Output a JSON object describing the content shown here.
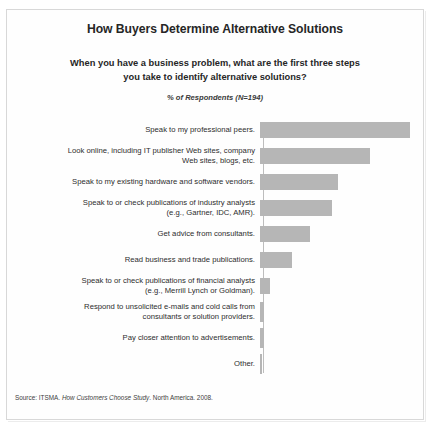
{
  "figure": {
    "title": "How Buyers Determine Alternative Solutions",
    "subtitle_line1": "When you have a business problem, what are the first three steps",
    "subtitle_line2": "you take to identify alternative solutions?",
    "note": "% of Respondents (N=194)",
    "source_prefix": "Source: ITSMA. ",
    "source_italic": "How Customers Choose Study",
    "source_suffix": ". North America. 2008.",
    "bar_color": "#b6b6b6",
    "axis_color": "#bdbdbd",
    "frame_color": "#d8d8d8"
  },
  "chart_data": {
    "type": "bar",
    "orientation": "horizontal",
    "title": "How Buyers Determine Alternative Solutions",
    "subtitle": "When you have a business problem, what are the first three steps you take to identify alternative solutions?",
    "xlabel": "% of Respondents (N=194)",
    "ylabel": "",
    "grid": false,
    "legend": null,
    "xlim": [
      0,
      100
    ],
    "sample_size": 194,
    "categories": [
      "Speak to my professional peers.",
      "Look online, including IT publisher Web sites, company Web sites, blogs, etc.",
      "Speak to my existing hardware and software vendors.",
      "Speak to or check publications of industry analysts (e.g., Gartner, IDC, AMR).",
      "Get advice from consultants.",
      "Read business and trade publications.",
      "Speak to or check publications of financial analysts (e.g., Merrill Lynch or Goldman).",
      "Respond to unsolicited e-mails and cold calls from consultants or solution providers.",
      "Pay closer attention to advertisements.",
      "Other."
    ],
    "category_lines": [
      [
        "Speak to my professional peers.",
        ""
      ],
      [
        "Look online, including IT publisher Web sites, company",
        "Web sites, blogs, etc."
      ],
      [
        "Speak to my existing hardware and software vendors.",
        ""
      ],
      [
        "Speak to or check publications of industry analysts",
        "(e.g., Gartner, IDC, AMR)."
      ],
      [
        "Get advice from consultants.",
        ""
      ],
      [
        "Read business and trade publications.",
        ""
      ],
      [
        "Speak to or check publications of financial analysts",
        "(e.g., Merrill Lynch or Goldman)."
      ],
      [
        "Respond to unsolicited e-mails and cold calls from",
        "consultants or solution providers."
      ],
      [
        "Pay closer attention to advertisements.",
        ""
      ],
      [
        "Other.",
        ""
      ]
    ],
    "values": [
      97,
      71,
      50,
      46,
      32,
      21,
      6,
      2,
      2,
      1
    ],
    "bar_pixel_widths": [
      150,
      110,
      78,
      72,
      50,
      32,
      10,
      4,
      4,
      2
    ]
  }
}
